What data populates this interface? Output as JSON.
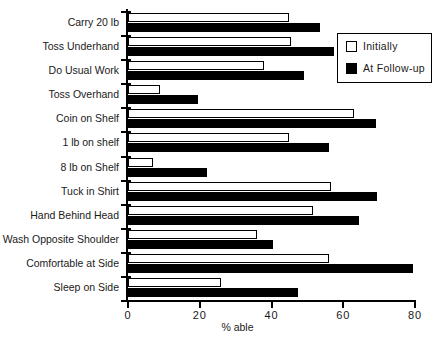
{
  "chart_data": {
    "type": "bar",
    "orientation": "horizontal",
    "title": "",
    "xlabel": "% able",
    "ylabel": "",
    "xlim": [
      0,
      80
    ],
    "xticks": [
      0,
      20,
      40,
      60,
      80
    ],
    "grid": false,
    "legend_position": "top-right",
    "categories": [
      "Carry 20 lb",
      "Toss Underhand",
      "Do Usual Work",
      "Toss Overhand",
      "Coin on Shelf",
      "1 lb on shelf",
      "8 lb on Shelf",
      "Tuck in Shirt",
      "Hand Behind Head",
      "Wash Opposite Shoulder",
      "Comfortable at Side",
      "Sleep on Side"
    ],
    "series": [
      {
        "name": "Initially",
        "color": "#ffffff",
        "values": [
          45,
          45.5,
          38,
          9,
          63,
          45,
          7,
          56.5,
          51.5,
          36,
          56,
          26
        ]
      },
      {
        "name": "At Follow-up",
        "color": "#000000",
        "values": [
          53.5,
          57.5,
          49,
          19.5,
          69,
          56,
          22,
          69.5,
          64.5,
          40.5,
          79.5,
          47.5
        ]
      }
    ]
  },
  "legend": {
    "items": [
      {
        "label": "Initially",
        "swatch": "open-square-icon"
      },
      {
        "label": "At Follow-up",
        "swatch": "filled-square-icon"
      }
    ]
  },
  "axis": {
    "x_title": "% able",
    "tick_labels": [
      "0",
      "20",
      "40",
      "60",
      "80"
    ]
  }
}
